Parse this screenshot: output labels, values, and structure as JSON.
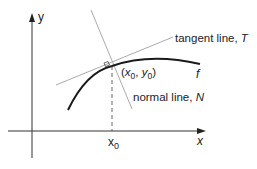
{
  "diagram": {
    "axes": {
      "x_label": "x",
      "y_label": "y"
    },
    "point": {
      "label_open": "(",
      "x_sym": "x",
      "x_sub": "0",
      "comma": ", ",
      "y_sym": "y",
      "y_sub": "0",
      "label_close": ")"
    },
    "x0_label": {
      "sym": "x",
      "sub": "0"
    },
    "tangent": {
      "label": "tangent line, ",
      "sym": "T"
    },
    "normal": {
      "label": "normal line, ",
      "sym": "N"
    },
    "curve": {
      "label": "f"
    },
    "colors": {
      "axis": "#333333",
      "curve": "#1a1a1a",
      "guide_lines": "#aaaaaa",
      "text": "#222222"
    }
  }
}
